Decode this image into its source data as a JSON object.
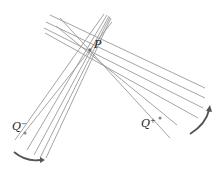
{
  "diagram": {
    "type": "pencil-of-lines",
    "labels": {
      "p": "P",
      "q_minus_base": "Q",
      "q_minus_sup": "−",
      "q_plus_base": "Q",
      "q_plus_sup": "+"
    },
    "colors": {
      "lines": "#9a9a9a",
      "arrow": "#555555",
      "dot": "#8a8a8a",
      "text": "#222222"
    },
    "point_p": [
      90,
      50
    ],
    "point_q_minus": [
      25,
      133
    ],
    "point_q_plus": [
      160,
      118
    ],
    "arrows": [
      {
        "name": "lower-left-rotation",
        "direction": "clockwise-down-right"
      },
      {
        "name": "right-rotation",
        "direction": "counterclockwise-up"
      }
    ]
  }
}
